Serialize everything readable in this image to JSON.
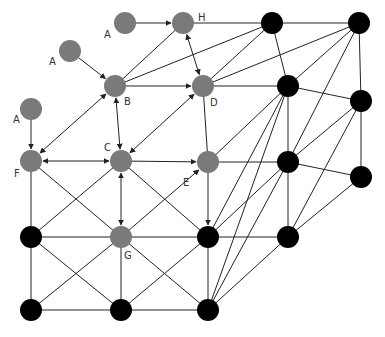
{
  "diagram": {
    "type": "cube-lattice-network",
    "colors": {
      "active_node": "#7a7a7a",
      "inactive_node": "#000000",
      "edge": "#222222",
      "label": "#333333"
    },
    "node_radius": 11,
    "nodes": [
      {
        "id": "A1",
        "label": "A",
        "x": 125,
        "y": 23,
        "kind": "active",
        "lx": 104,
        "ly": 38
      },
      {
        "id": "A2",
        "label": "A",
        "x": 70,
        "y": 51,
        "kind": "active",
        "lx": 49,
        "ly": 65
      },
      {
        "id": "A3",
        "label": "A",
        "x": 31,
        "y": 109,
        "kind": "active",
        "lx": 13,
        "ly": 123
      },
      {
        "id": "H",
        "label": "H",
        "x": 183,
        "y": 23,
        "kind": "active",
        "lx": 198,
        "ly": 21
      },
      {
        "id": "B",
        "label": "B",
        "x": 115,
        "y": 86,
        "kind": "active",
        "lx": 124,
        "ly": 105
      },
      {
        "id": "D",
        "label": "D",
        "x": 203,
        "y": 86,
        "kind": "active",
        "lx": 210,
        "ly": 106
      },
      {
        "id": "F",
        "label": "F",
        "x": 31,
        "y": 161,
        "kind": "active",
        "lx": 14,
        "ly": 177
      },
      {
        "id": "C",
        "label": "C",
        "x": 121,
        "y": 161,
        "kind": "active",
        "lx": 104,
        "ly": 151
      },
      {
        "id": "Enode",
        "label": "",
        "x": 208,
        "y": 162,
        "kind": "active"
      },
      {
        "id": "G",
        "label": "G",
        "x": 121,
        "y": 237,
        "kind": "active",
        "lx": 124,
        "ly": 259
      },
      {
        "id": "K1",
        "label": "",
        "x": 272,
        "y": 23,
        "kind": "inactive"
      },
      {
        "id": "K2",
        "label": "",
        "x": 359,
        "y": 23,
        "kind": "inactive"
      },
      {
        "id": "K3",
        "label": "",
        "x": 288,
        "y": 86,
        "kind": "inactive"
      },
      {
        "id": "K4",
        "label": "",
        "x": 361,
        "y": 101,
        "kind": "inactive"
      },
      {
        "id": "K5",
        "label": "",
        "x": 288,
        "y": 162,
        "kind": "inactive"
      },
      {
        "id": "K6",
        "label": "",
        "x": 361,
        "y": 177,
        "kind": "inactive"
      },
      {
        "id": "K7",
        "label": "",
        "x": 31,
        "y": 237,
        "kind": "inactive"
      },
      {
        "id": "K8",
        "label": "",
        "x": 208,
        "y": 237,
        "kind": "inactive"
      },
      {
        "id": "K9",
        "label": "",
        "x": 288,
        "y": 237,
        "kind": "inactive"
      },
      {
        "id": "K10",
        "label": "",
        "x": 31,
        "y": 310,
        "kind": "inactive"
      },
      {
        "id": "K11",
        "label": "",
        "x": 121,
        "y": 310,
        "kind": "inactive"
      },
      {
        "id": "K12",
        "label": "",
        "x": 208,
        "y": 310,
        "kind": "inactive"
      }
    ],
    "edge_labels": [
      {
        "label": "E",
        "x": 183,
        "y": 186
      }
    ],
    "edges": [
      {
        "from": "A1",
        "to": "H",
        "arrow": "end"
      },
      {
        "from": "A2",
        "to": "B",
        "arrow": "end"
      },
      {
        "from": "A3",
        "to": "F",
        "arrow": "end"
      },
      {
        "from": "H",
        "to": "D",
        "arrow": "both"
      },
      {
        "from": "B",
        "to": "D",
        "arrow": "end"
      },
      {
        "from": "F",
        "to": "B",
        "arrow": "both"
      },
      {
        "from": "C",
        "to": "B",
        "arrow": "both"
      },
      {
        "from": "D",
        "to": "C",
        "arrow": "both"
      },
      {
        "from": "F",
        "to": "C",
        "arrow": "both"
      },
      {
        "from": "C",
        "to": "Enode",
        "arrow": "end"
      },
      {
        "from": "G",
        "to": "Enode",
        "arrow": "end"
      },
      {
        "from": "C",
        "to": "G",
        "arrow": "both"
      },
      {
        "from": "Enode",
        "to": "K8",
        "arrow": "end"
      },
      {
        "from": "B",
        "to": "H",
        "arrow": "none"
      },
      {
        "from": "B",
        "to": "K1",
        "arrow": "none"
      },
      {
        "from": "H",
        "to": "K1",
        "arrow": "none"
      },
      {
        "from": "K1",
        "to": "K2",
        "arrow": "none"
      },
      {
        "from": "D",
        "to": "K1",
        "arrow": "none"
      },
      {
        "from": "D",
        "to": "K2",
        "arrow": "none"
      },
      {
        "from": "D",
        "to": "K3",
        "arrow": "none"
      },
      {
        "from": "D",
        "to": "Enode",
        "arrow": "none"
      },
      {
        "from": "K1",
        "to": "K3",
        "arrow": "none"
      },
      {
        "from": "K2",
        "to": "K3",
        "arrow": "none"
      },
      {
        "from": "K2",
        "to": "K4",
        "arrow": "none"
      },
      {
        "from": "K2",
        "to": "K5",
        "arrow": "none"
      },
      {
        "from": "K3",
        "to": "K4",
        "arrow": "none"
      },
      {
        "from": "K3",
        "to": "K5",
        "arrow": "none"
      },
      {
        "from": "K3",
        "to": "Enode",
        "arrow": "none"
      },
      {
        "from": "K3",
        "to": "K8",
        "arrow": "none"
      },
      {
        "from": "K4",
        "to": "K5",
        "arrow": "none"
      },
      {
        "from": "K4",
        "to": "K6",
        "arrow": "none"
      },
      {
        "from": "K4",
        "to": "K9",
        "arrow": "none"
      },
      {
        "from": "K5",
        "to": "K6",
        "arrow": "none"
      },
      {
        "from": "K5",
        "to": "Enode",
        "arrow": "none"
      },
      {
        "from": "K5",
        "to": "K8",
        "arrow": "none"
      },
      {
        "from": "K5",
        "to": "K9",
        "arrow": "none"
      },
      {
        "from": "K5",
        "to": "K12",
        "arrow": "none"
      },
      {
        "from": "K3",
        "to": "K12",
        "arrow": "none"
      },
      {
        "from": "K6",
        "to": "K9",
        "arrow": "none"
      },
      {
        "from": "K8",
        "to": "K9",
        "arrow": "none"
      },
      {
        "from": "K9",
        "to": "K12",
        "arrow": "none"
      },
      {
        "from": "F",
        "to": "K7",
        "arrow": "none"
      },
      {
        "from": "F",
        "to": "G",
        "arrow": "none"
      },
      {
        "from": "C",
        "to": "K7",
        "arrow": "none"
      },
      {
        "from": "C",
        "to": "K8",
        "arrow": "none"
      },
      {
        "from": "K7",
        "to": "G",
        "arrow": "none"
      },
      {
        "from": "G",
        "to": "K8",
        "arrow": "none"
      },
      {
        "from": "K7",
        "to": "K10",
        "arrow": "none"
      },
      {
        "from": "K7",
        "to": "K11",
        "arrow": "none"
      },
      {
        "from": "G",
        "to": "K10",
        "arrow": "none"
      },
      {
        "from": "G",
        "to": "K11",
        "arrow": "none"
      },
      {
        "from": "G",
        "to": "K12",
        "arrow": "none"
      },
      {
        "from": "K8",
        "to": "K11",
        "arrow": "none"
      },
      {
        "from": "K8",
        "to": "K12",
        "arrow": "none"
      },
      {
        "from": "K10",
        "to": "K11",
        "arrow": "none"
      },
      {
        "from": "K11",
        "to": "K12",
        "arrow": "none"
      }
    ]
  }
}
